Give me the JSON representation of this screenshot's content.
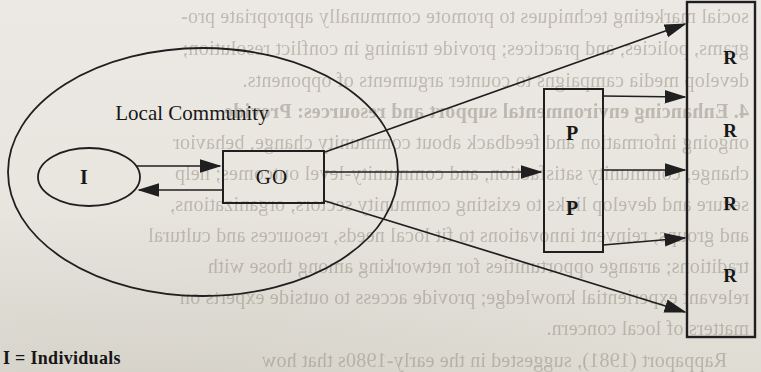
{
  "page": {
    "background_color": "#e9e6e0",
    "ink_color": "#1f1f1f",
    "bleed_text_color": "#8f887c"
  },
  "diagram": {
    "community_label": "Local Community",
    "individuals_label": "I",
    "go_label": "GO",
    "p_label_top": "P",
    "p_label_bottom": "P",
    "r_label_1": "R",
    "r_label_2": "R",
    "r_label_3": "R",
    "r_label_4": "R",
    "legend": "I = Individuals"
  },
  "bleed_through": {
    "lines": [
      "social marketing techniques to promote communally appropriate pro-",
      "grams, policies, and practices; provide training in conflict resolution;",
      "develop media campaigns to counter arguments of opponents.",
      "4. Enhancing environmental support and resources: Provide",
      "ongoing information and feedback about community change, behavior",
      "change, community satisfaction, and community-level outcomes; help",
      "secure and develop links to existing community sectors, organizations,",
      "and groups; reinvent innovations to fit local needs, resources and cultural",
      "traditions; arrange opportunities for networking among those with",
      "relevant experiential knowledge; provide access to outside experts on",
      "matters of local concern.",
      "Rappaport (1981), suggested in the early-1980s that how"
    ]
  }
}
